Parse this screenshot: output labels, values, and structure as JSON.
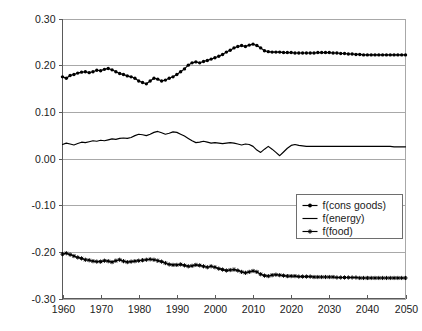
{
  "chart_data": {
    "type": "line",
    "title": "",
    "subtitle": "",
    "xlabel": "",
    "ylabel": "",
    "xlim": [
      1960,
      2050
    ],
    "ylim": [
      -0.3,
      0.3
    ],
    "grid": true,
    "legend_position": "middle-right",
    "x_ticks": [
      "1960",
      "1970",
      "1980",
      "1990",
      "2000",
      "2010",
      "2020",
      "2030",
      "2040",
      "2050"
    ],
    "x_tick_values": [
      1960,
      1970,
      1980,
      1990,
      2000,
      2010,
      2020,
      2030,
      2040,
      2050
    ],
    "y_ticks": [
      "0.30",
      "0.20",
      "0.10",
      "0.00",
      "-0.10",
      "-0.20",
      "-0.30"
    ],
    "y_tick_values": [
      0.3,
      0.2,
      0.1,
      0.0,
      -0.1,
      -0.2,
      -0.3
    ],
    "x": [
      1960,
      1961,
      1962,
      1963,
      1964,
      1965,
      1966,
      1967,
      1968,
      1969,
      1970,
      1971,
      1972,
      1973,
      1974,
      1975,
      1976,
      1977,
      1978,
      1979,
      1980,
      1981,
      1982,
      1983,
      1984,
      1985,
      1986,
      1987,
      1988,
      1989,
      1990,
      1991,
      1992,
      1993,
      1994,
      1995,
      1996,
      1997,
      1998,
      1999,
      2000,
      2001,
      2002,
      2003,
      2004,
      2005,
      2006,
      2007,
      2008,
      2009,
      2010,
      2011,
      2012,
      2013,
      2014,
      2015,
      2016,
      2017,
      2018,
      2019,
      2020,
      2021,
      2022,
      2023,
      2024,
      2025,
      2026,
      2027,
      2028,
      2029,
      2030,
      2031,
      2032,
      2033,
      2034,
      2035,
      2036,
      2037,
      2038,
      2039,
      2040,
      2041,
      2042,
      2043,
      2044,
      2045,
      2046,
      2047,
      2048,
      2049,
      2050
    ],
    "series": [
      {
        "name": "f(cons goods)",
        "marker": "dot",
        "color": "#000000",
        "values": [
          0.175,
          0.172,
          0.178,
          0.18,
          0.183,
          0.185,
          0.186,
          0.184,
          0.186,
          0.189,
          0.188,
          0.191,
          0.193,
          0.19,
          0.186,
          0.182,
          0.18,
          0.177,
          0.175,
          0.172,
          0.166,
          0.163,
          0.16,
          0.166,
          0.172,
          0.17,
          0.166,
          0.168,
          0.172,
          0.175,
          0.18,
          0.186,
          0.192,
          0.2,
          0.205,
          0.207,
          0.205,
          0.208,
          0.21,
          0.213,
          0.216,
          0.219,
          0.223,
          0.228,
          0.232,
          0.237,
          0.24,
          0.242,
          0.24,
          0.243,
          0.245,
          0.242,
          0.237,
          0.231,
          0.229,
          0.228,
          0.228,
          0.228,
          0.227,
          0.227,
          0.227,
          0.226,
          0.226,
          0.226,
          0.226,
          0.226,
          0.226,
          0.227,
          0.227,
          0.227,
          0.227,
          0.226,
          0.226,
          0.225,
          0.225,
          0.224,
          0.224,
          0.223,
          0.223,
          0.222,
          0.222,
          0.222,
          0.222,
          0.222,
          0.222,
          0.222,
          0.222,
          0.222,
          0.222,
          0.222,
          0.222
        ]
      },
      {
        "name": "f(energy)",
        "marker": "none",
        "color": "#000000",
        "values": [
          0.03,
          0.033,
          0.031,
          0.029,
          0.032,
          0.035,
          0.034,
          0.036,
          0.038,
          0.037,
          0.039,
          0.038,
          0.04,
          0.042,
          0.041,
          0.043,
          0.044,
          0.043,
          0.045,
          0.049,
          0.052,
          0.051,
          0.049,
          0.052,
          0.056,
          0.058,
          0.055,
          0.052,
          0.054,
          0.057,
          0.056,
          0.052,
          0.048,
          0.043,
          0.038,
          0.034,
          0.035,
          0.037,
          0.035,
          0.033,
          0.034,
          0.033,
          0.032,
          0.033,
          0.034,
          0.033,
          0.031,
          0.029,
          0.031,
          0.03,
          0.026,
          0.018,
          0.013,
          0.02,
          0.026,
          0.02,
          0.013,
          0.006,
          0.014,
          0.022,
          0.028,
          0.03,
          0.028,
          0.027,
          0.026,
          0.026,
          0.026,
          0.026,
          0.026,
          0.026,
          0.026,
          0.026,
          0.026,
          0.026,
          0.026,
          0.026,
          0.026,
          0.026,
          0.026,
          0.026,
          0.026,
          0.026,
          0.026,
          0.026,
          0.026,
          0.026,
          0.026,
          0.025,
          0.025,
          0.025,
          0.025
        ]
      },
      {
        "name": "f(food)",
        "marker": "star",
        "color": "#000000",
        "values": [
          -0.205,
          -0.203,
          -0.206,
          -0.209,
          -0.212,
          -0.214,
          -0.217,
          -0.218,
          -0.22,
          -0.221,
          -0.221,
          -0.219,
          -0.22,
          -0.222,
          -0.219,
          -0.217,
          -0.22,
          -0.222,
          -0.221,
          -0.22,
          -0.219,
          -0.218,
          -0.217,
          -0.216,
          -0.217,
          -0.219,
          -0.221,
          -0.224,
          -0.227,
          -0.228,
          -0.228,
          -0.227,
          -0.229,
          -0.231,
          -0.23,
          -0.228,
          -0.229,
          -0.231,
          -0.233,
          -0.231,
          -0.233,
          -0.236,
          -0.238,
          -0.24,
          -0.239,
          -0.238,
          -0.24,
          -0.243,
          -0.245,
          -0.243,
          -0.241,
          -0.243,
          -0.248,
          -0.251,
          -0.252,
          -0.25,
          -0.249,
          -0.25,
          -0.251,
          -0.252,
          -0.252,
          -0.252,
          -0.253,
          -0.253,
          -0.253,
          -0.253,
          -0.254,
          -0.254,
          -0.254,
          -0.254,
          -0.254,
          -0.254,
          -0.255,
          -0.255,
          -0.255,
          -0.255,
          -0.255,
          -0.255,
          -0.256,
          -0.256,
          -0.256,
          -0.256,
          -0.256,
          -0.256,
          -0.256,
          -0.256,
          -0.256,
          -0.256,
          -0.256,
          -0.256,
          -0.256
        ]
      }
    ],
    "legend": [
      {
        "label": "f(cons goods)",
        "marker": "dot"
      },
      {
        "label": "f(energy)",
        "marker": "line"
      },
      {
        "label": "f(food)",
        "marker": "star"
      }
    ]
  }
}
